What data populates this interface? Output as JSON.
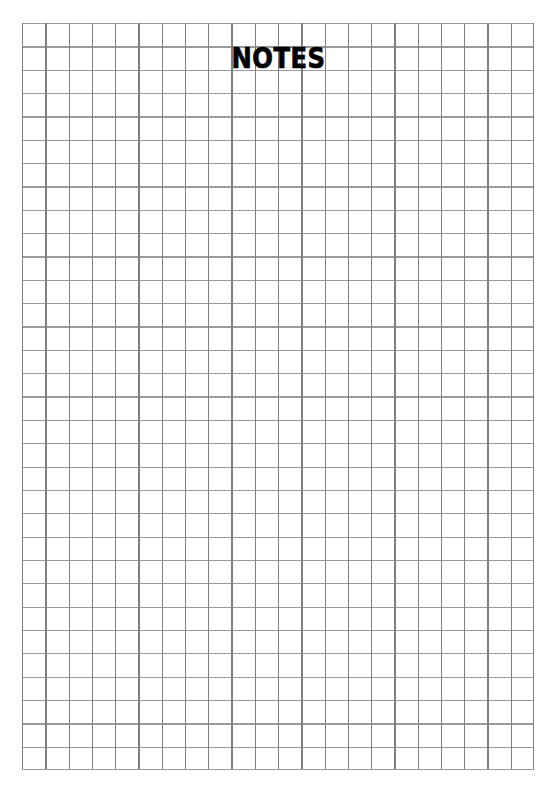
{
  "page": {
    "width": 557,
    "height": 794,
    "background_color": "#ffffff",
    "kind": "grid-notepaper"
  },
  "title": {
    "text": "NOTES",
    "color": "#000000",
    "weight": "bold",
    "align": "center"
  },
  "grid": {
    "origin_x": 22,
    "origin_y": 23,
    "width": 512,
    "height": 747,
    "columns": 22,
    "rows": 32,
    "cell_width": 23.27,
    "cell_height": 23.34,
    "line_color_vertical": "#7f7f7f",
    "line_color_horizontal": "#9a9a9a",
    "line_width": 1.3
  }
}
